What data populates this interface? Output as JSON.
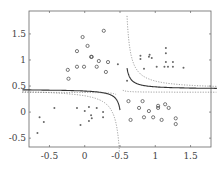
{
  "chart_data": {
    "type": "scatter",
    "title": "",
    "xlabel": "",
    "ylabel": "",
    "xlim": [
      -0.79,
      1.79
    ],
    "ylim": [
      -0.67,
      1.94
    ],
    "grid": false,
    "legend": null,
    "x_ticks": [
      {
        "value": -0.5,
        "label": "-0.5"
      },
      {
        "value": 0,
        "label": "0"
      },
      {
        "value": 0.5,
        "label": "-0.5"
      },
      {
        "value": 1,
        "label": "1"
      },
      {
        "value": 1.5,
        "label": "1.5"
      }
    ],
    "y_ticks": [
      {
        "value": 1.5,
        "label": "1.5"
      },
      {
        "value": 1,
        "label": "1"
      },
      {
        "value": 0.5,
        "label": "0.5"
      },
      {
        "value": 0,
        "label": "0"
      },
      {
        "value": -0.5,
        "label": "-0.5"
      }
    ],
    "series": [
      {
        "name": "class-circles-upper-left",
        "marker": "circle",
        "points": [
          [
            0.27,
            1.56
          ],
          [
            -0.03,
            1.44
          ],
          [
            -0.11,
            1.17
          ],
          [
            0.04,
            1.27
          ],
          [
            0.09,
            1.06
          ],
          [
            0.1,
            1.06
          ],
          [
            0.2,
            0.98
          ],
          [
            -0.24,
            0.81
          ],
          [
            -0.11,
            0.87
          ],
          [
            -0.01,
            0.87
          ],
          [
            0.17,
            0.87
          ],
          [
            -0.23,
            0.64
          ],
          [
            0.3,
            0.77
          ],
          [
            0.33,
            0.96
          ]
        ]
      },
      {
        "name": "class-dots-upper-right",
        "marker": "dot",
        "points": [
          [
            0.79,
            1.08
          ],
          [
            0.79,
            1.02
          ],
          [
            0.91,
            1.06
          ],
          [
            0.92,
            1.1
          ],
          [
            0.95,
            1.04
          ],
          [
            1.15,
            1.23
          ],
          [
            1.15,
            1.13
          ],
          [
            1.15,
            0.96
          ],
          [
            1.13,
            0.87
          ],
          [
            1.18,
            0.87
          ],
          [
            1.25,
            0.96
          ],
          [
            1.25,
            0.87
          ],
          [
            1.02,
            0.87
          ],
          [
            0.84,
            0.83
          ],
          [
            1.4,
            0.85
          ],
          [
            0.6,
            0.6
          ],
          [
            0.47,
            0.92
          ]
        ]
      },
      {
        "name": "class-dots-lower-left",
        "marker": "dot",
        "points": [
          [
            -0.43,
            0.08
          ],
          [
            -0.11,
            0.08
          ],
          [
            0.0,
            0.02
          ],
          [
            0.06,
            0.1
          ],
          [
            0.09,
            -0.06
          ],
          [
            0.17,
            0.08
          ],
          [
            0.1,
            -0.12
          ],
          [
            0.26,
            -0.1
          ],
          [
            -0.64,
            -0.1
          ],
          [
            -0.58,
            -0.19
          ],
          [
            0.06,
            -0.17
          ],
          [
            -0.67,
            -0.4
          ],
          [
            -0.06,
            -0.25
          ],
          [
            0.26,
            0.0
          ]
        ]
      },
      {
        "name": "class-circles-lower-right",
        "marker": "circle",
        "points": [
          [
            0.62,
            0.21
          ],
          [
            0.82,
            0.21
          ],
          [
            0.77,
            0.08
          ],
          [
            0.91,
            0.02
          ],
          [
            1.04,
            0.08
          ],
          [
            0.97,
            -0.1
          ],
          [
            0.84,
            -0.1
          ],
          [
            1.04,
            0.12
          ],
          [
            1.14,
            0.15
          ],
          [
            1.19,
            0.08
          ],
          [
            1.09,
            -0.15
          ],
          [
            1.29,
            -0.12
          ],
          [
            1.29,
            -0.23
          ],
          [
            0.65,
            -0.15
          ]
        ]
      }
    ],
    "curves": [
      {
        "name": "decision-boundary",
        "style": "solid",
        "description": "hyperbola-like boundary, asymptotes near x≈0.5 and y≈0.45"
      },
      {
        "name": "margin-upper",
        "style": "dotted"
      },
      {
        "name": "margin-lower",
        "style": "dotted"
      }
    ]
  }
}
